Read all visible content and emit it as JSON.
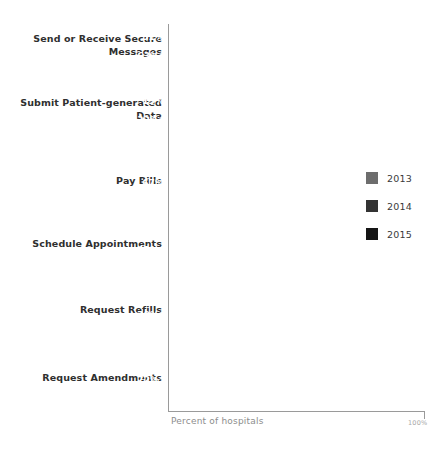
{
  "chart_data": {
    "type": "bar",
    "orientation": "horizontal",
    "title": "",
    "subtitle": "",
    "xlabel": "Percent of hospitals",
    "ylabel": "",
    "xlim": [
      0,
      100
    ],
    "xtick_labels": [
      "100%"
    ],
    "grid": false,
    "legend_position": "right",
    "legend": [
      "2013",
      "2014",
      "2015"
    ],
    "series": [
      {
        "name": "2013",
        "color": "#6d6d6d",
        "values": [
          null,
          13,
          55,
          29,
          27,
          33
        ],
        "labels": [
          "",
          "13%",
          "55%",
          "29%",
          "27%",
          "33%"
        ]
      },
      {
        "name": "2014",
        "color": "#333333",
        "values": [
          51,
          32,
          67,
          41,
          39,
          72
        ],
        "labels": [
          "51%",
          "32%*",
          "67%",
          "41%*",
          "39%*",
          "72%*"
        ]
      },
      {
        "name": "2015",
        "color": "#151515",
        "values": [
          63,
          37,
          74,
          44,
          42,
          77
        ],
        "labels": [
          "63%*",
          "37%*",
          "74%*",
          "44%",
          "42%*",
          "77%*"
        ]
      }
    ],
    "categories": [
      "Send or Receive Secure Messages",
      "Submit Patient-generated Data",
      "Pay Bills",
      "Schedule Appointments",
      "Request Refills",
      "Request Amendments"
    ],
    "category_lines": [
      [
        "Send or Receive Secure",
        "Messages"
      ],
      [
        "Submit Patient-generated",
        "Data"
      ],
      [
        "Pay Bills"
      ],
      [
        "Schedule Appointments"
      ],
      [
        "Request Refills"
      ],
      [
        "Request Amendments"
      ]
    ]
  },
  "groups": [
    {
      "label_line1": "Send or Receive Secure",
      "label_line2": "Messages",
      "bars": [
        {
          "series": "2014",
          "value": 51,
          "label": "51%"
        },
        {
          "series": "2015",
          "value": 63,
          "label": "63%*"
        }
      ]
    },
    {
      "label_line1": "Submit Patient-generated",
      "label_line2": "Data",
      "bars": [
        {
          "series": "2013",
          "value": 13,
          "label": "13%"
        },
        {
          "series": "2014",
          "value": 32,
          "label": "32%*"
        },
        {
          "series": "2015",
          "value": 37,
          "label": "37%*"
        }
      ]
    },
    {
      "label_line1": "Pay Bills",
      "label_line2": "",
      "bars": [
        {
          "series": "2013",
          "value": 55,
          "label": "55%"
        },
        {
          "series": "2014",
          "value": 67,
          "label": "67%"
        },
        {
          "series": "2015",
          "value": 74,
          "label": "74%*"
        }
      ]
    },
    {
      "label_line1": "Schedule Appointments",
      "label_line2": "",
      "bars": [
        {
          "series": "2013",
          "value": 29,
          "label": "29%"
        },
        {
          "series": "2014",
          "value": 41,
          "label": "41%*"
        },
        {
          "series": "2015",
          "value": 44,
          "label": "44%"
        }
      ]
    },
    {
      "label_line1": "Request Refills",
      "label_line2": "",
      "bars": [
        {
          "series": "2013",
          "value": 27,
          "label": "27%"
        },
        {
          "series": "2014",
          "value": 39,
          "label": "39%*"
        },
        {
          "series": "2015",
          "value": 42,
          "label": "42%*"
        }
      ]
    },
    {
      "label_line1": "Request Amendments",
      "label_line2": "",
      "bars": [
        {
          "series": "2013",
          "value": 33,
          "label": "33%"
        },
        {
          "series": "2014",
          "value": 72,
          "label": "72%*"
        },
        {
          "series": "2015",
          "value": 77,
          "label": "77%*"
        }
      ]
    }
  ],
  "legend": {
    "items": [
      {
        "label": "2013",
        "color": "#6d6d6d"
      },
      {
        "label": "2014",
        "color": "#333333"
      },
      {
        "label": "2015",
        "color": "#151515"
      }
    ]
  },
  "axis": {
    "caption": "Percent of hospitals",
    "max_label": "100%"
  }
}
